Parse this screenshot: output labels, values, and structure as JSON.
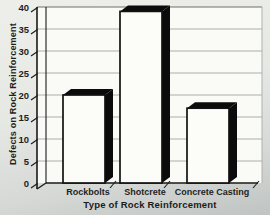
{
  "figure": {
    "kind": "scanned black-and-white 3D bar chart",
    "colors": {
      "bar_fill": "#fcfcf9",
      "bar_edge": "#121212",
      "bar_shadow": "#0b0b0b",
      "grid": "#9a9a9a",
      "grid_top": "#6e6e6e",
      "axis": "#1a1a1a",
      "plot_bg": "#fafaf7",
      "paper": "#e6e8e4",
      "text": "#1f1f1f"
    }
  },
  "chart_data": {
    "type": "bar",
    "title": "",
    "categories": [
      "Rockbolts",
      "Shotcrete",
      "Concrete Casting"
    ],
    "values": [
      20,
      39,
      17
    ],
    "series": [
      {
        "name": "Defects",
        "values": [
          20,
          39,
          17
        ]
      }
    ],
    "xlabel": "Type of Rock Reinforcement",
    "ylabel": "Defects on Rock Reinforcement",
    "ylim": [
      0,
      40
    ],
    "yticks": [
      0,
      5,
      10,
      15,
      20,
      25,
      30,
      35,
      40
    ],
    "grid": "horizontal",
    "legend": "none",
    "bar_style": "white front face with solid black 3D extrusion offset to the top-right"
  }
}
